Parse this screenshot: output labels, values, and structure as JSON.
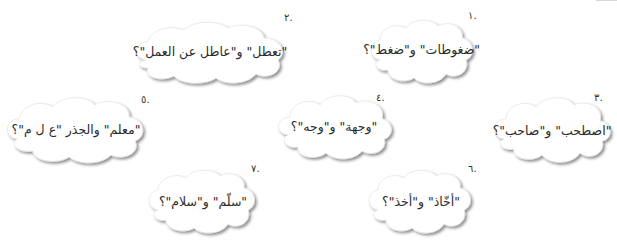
{
  "page": {
    "direction": "rtl",
    "background": "#ffffff",
    "cloud_fill": "#ffffff",
    "cloud_shadow": "#bdbdbd",
    "text_color": "#2b2b2b"
  },
  "items": [
    {
      "number": ".١",
      "text": "\"ضغوطات\" و\"ضغط\"؟"
    },
    {
      "number": ".٢",
      "text": "\"تعطل\" و\"عاطل عن العمل\"؟"
    },
    {
      "number": ".٣",
      "text": "\"اصطحب\" و\"صاحب\"؟"
    },
    {
      "number": ".٤",
      "text": "\"وجهة\" و\"وجه\"؟"
    },
    {
      "number": ".٥",
      "text": "\"معلم\" والجذر \"ع ل م\"؟"
    },
    {
      "number": ".٦",
      "text": "\"أخّاذ\" و\"أخذ\"؟"
    },
    {
      "number": ".٧",
      "text": "\"سلّم\" و\"سلام\"؟"
    }
  ]
}
